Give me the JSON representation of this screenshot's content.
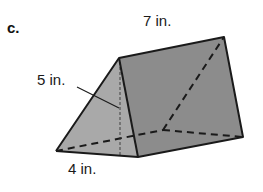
{
  "problem": {
    "letter": "c."
  },
  "figure": {
    "type": "triangular-prism",
    "labels": {
      "length": "7 in.",
      "height": "5 in.",
      "base": "4 in."
    },
    "colors": {
      "front_face": "#a9a9a9",
      "side_face": "#8c8c8c",
      "edge": "#1a1a1a",
      "background": "#ffffff"
    }
  }
}
